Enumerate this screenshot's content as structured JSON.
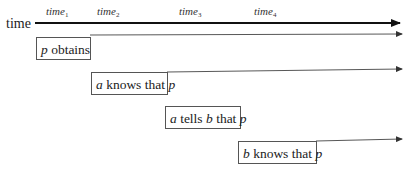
{
  "axis": {
    "label": "time"
  },
  "time_points": [
    {
      "base": "time",
      "sub": "1"
    },
    {
      "base": "time",
      "sub": "2"
    },
    {
      "base": "time",
      "sub": "3"
    },
    {
      "base": "time",
      "sub": "4"
    }
  ],
  "events": [
    {
      "parts": [
        {
          "t": "p",
          "i": true
        },
        {
          "t": " obtains",
          "i": false
        }
      ]
    },
    {
      "parts": [
        {
          "t": "a",
          "i": true
        },
        {
          "t": " knows that ",
          "i": false
        },
        {
          "t": "p",
          "i": true
        }
      ]
    },
    {
      "parts": [
        {
          "t": "a",
          "i": true
        },
        {
          "t": " tells ",
          "i": false
        },
        {
          "t": "b",
          "i": true
        },
        {
          "t": " that ",
          "i": false
        },
        {
          "t": "p",
          "i": true
        }
      ]
    },
    {
      "parts": [
        {
          "t": "b",
          "i": true
        },
        {
          "t": " knows that ",
          "i": false
        },
        {
          "t": "p",
          "i": true
        }
      ]
    }
  ],
  "colors": {
    "main_axis": "#111111",
    "state_lines": "#444444",
    "box_border": "#555555"
  }
}
